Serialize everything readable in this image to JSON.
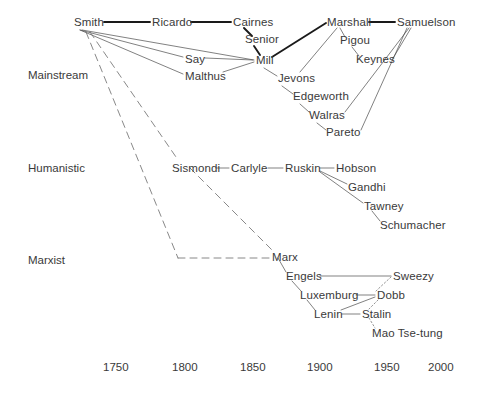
{
  "figure": {
    "type": "network-genealogy-timeline",
    "background_color": "#ffffff",
    "text_color": "#3a3a3a"
  },
  "bands": [
    {
      "id": "mainstream",
      "label": "Mainstream",
      "x": 28,
      "y": 69
    },
    {
      "id": "humanistic",
      "label": "Humanistic",
      "x": 28,
      "y": 162
    },
    {
      "id": "marxist",
      "label": "Marxist",
      "x": 28,
      "y": 254
    }
  ],
  "axis": {
    "label": "",
    "ticks": [
      {
        "value": "1750",
        "x": 103,
        "y": 361
      },
      {
        "value": "1800",
        "x": 172,
        "y": 361
      },
      {
        "value": "1850",
        "x": 240,
        "y": 361
      },
      {
        "value": "1900",
        "x": 307,
        "y": 361
      },
      {
        "value": "1950",
        "x": 374,
        "y": 361
      },
      {
        "value": "2000",
        "x": 428,
        "y": 361
      }
    ]
  },
  "nodes": [
    {
      "id": "smith",
      "label": "Smith",
      "x": 74,
      "y": 16,
      "band": "mainstream"
    },
    {
      "id": "ricardo",
      "label": "Ricardo",
      "x": 152,
      "y": 16,
      "band": "mainstream"
    },
    {
      "id": "cairnes",
      "label": "Cairnes",
      "x": 233,
      "y": 16,
      "band": "mainstream"
    },
    {
      "id": "senior",
      "label": "Senior",
      "x": 245,
      "y": 33,
      "band": "mainstream"
    },
    {
      "id": "say",
      "label": "Say",
      "x": 185,
      "y": 53,
      "band": "mainstream"
    },
    {
      "id": "malthus",
      "label": "Malthus",
      "x": 185,
      "y": 70,
      "band": "mainstream"
    },
    {
      "id": "mill",
      "label": "Mill",
      "x": 256,
      "y": 54,
      "band": "mainstream"
    },
    {
      "id": "jevons",
      "label": "Jevons",
      "x": 278,
      "y": 72,
      "band": "mainstream"
    },
    {
      "id": "edgeworth",
      "label": "Edgeworth",
      "x": 293,
      "y": 90,
      "band": "mainstream"
    },
    {
      "id": "walras",
      "label": "Walras",
      "x": 309,
      "y": 109,
      "band": "mainstream"
    },
    {
      "id": "pareto",
      "label": "Pareto",
      "x": 326,
      "y": 126,
      "band": "mainstream"
    },
    {
      "id": "marshall",
      "label": "Marshall",
      "x": 327,
      "y": 16,
      "band": "mainstream"
    },
    {
      "id": "samuelson",
      "label": "Samuelson",
      "x": 397,
      "y": 16,
      "band": "mainstream"
    },
    {
      "id": "pigou",
      "label": "Pigou",
      "x": 340,
      "y": 34,
      "band": "mainstream"
    },
    {
      "id": "keynes",
      "label": "Keynes",
      "x": 356,
      "y": 53,
      "band": "mainstream"
    },
    {
      "id": "sismondi",
      "label": "Sismondi",
      "x": 172,
      "y": 162,
      "band": "humanistic"
    },
    {
      "id": "carlyle",
      "label": "Carlyle",
      "x": 231,
      "y": 162,
      "band": "humanistic"
    },
    {
      "id": "ruskin",
      "label": "Ruskin",
      "x": 285,
      "y": 162,
      "band": "humanistic"
    },
    {
      "id": "hobson",
      "label": "Hobson",
      "x": 336,
      "y": 162,
      "band": "humanistic"
    },
    {
      "id": "gandhi",
      "label": "Gandhi",
      "x": 348,
      "y": 181,
      "band": "humanistic"
    },
    {
      "id": "tawney",
      "label": "Tawney",
      "x": 364,
      "y": 200,
      "band": "humanistic"
    },
    {
      "id": "schumacher",
      "label": "Schumacher",
      "x": 380,
      "y": 219,
      "band": "humanistic"
    },
    {
      "id": "marx",
      "label": "Marx",
      "x": 272,
      "y": 251,
      "band": "marxist"
    },
    {
      "id": "engels",
      "label": "Engels",
      "x": 286,
      "y": 270,
      "band": "marxist"
    },
    {
      "id": "sweezy",
      "label": "Sweezy",
      "x": 393,
      "y": 270,
      "band": "marxist"
    },
    {
      "id": "luxemburg",
      "label": "Luxemburg",
      "x": 300,
      "y": 289,
      "band": "marxist"
    },
    {
      "id": "dobb",
      "label": "Dobb",
      "x": 377,
      "y": 289,
      "band": "marxist"
    },
    {
      "id": "lenin",
      "label": "Lenin",
      "x": 314,
      "y": 308,
      "band": "marxist"
    },
    {
      "id": "stalin",
      "label": "Stalin",
      "x": 362,
      "y": 308,
      "band": "marxist"
    },
    {
      "id": "mao",
      "label": "Mao Tse-tung",
      "x": 372,
      "y": 327,
      "band": "marxist"
    }
  ],
  "edges": [
    {
      "from": "smith",
      "to": "ricardo",
      "style": "thick",
      "x1": 104,
      "y1": 22,
      "x2": 150,
      "y2": 22
    },
    {
      "from": "ricardo",
      "to": "cairnes",
      "style": "thick",
      "x1": 191,
      "y1": 22,
      "x2": 231,
      "y2": 22
    },
    {
      "from": "cairnes",
      "to": "senior",
      "style": "thick",
      "x1": 244,
      "y1": 28,
      "x2": 252,
      "y2": 36
    },
    {
      "from": "senior",
      "to": "mill",
      "style": "thick",
      "x1": 254,
      "y1": 46,
      "x2": 260,
      "y2": 55
    },
    {
      "from": "mill",
      "to": "marshall",
      "style": "thick",
      "x1": 272,
      "y1": 57,
      "x2": 326,
      "y2": 23
    },
    {
      "from": "marshall",
      "to": "samuelson",
      "style": "thick",
      "x1": 369,
      "y1": 22,
      "x2": 395,
      "y2": 22
    },
    {
      "from": "smith",
      "to": "say",
      "style": "thin",
      "x1": 80,
      "y1": 30,
      "x2": 183,
      "y2": 57
    },
    {
      "from": "smith",
      "to": "malthus",
      "style": "thin",
      "x1": 80,
      "y1": 30,
      "x2": 183,
      "y2": 74
    },
    {
      "from": "smith",
      "to": "mill",
      "style": "thin",
      "x1": 82,
      "y1": 30,
      "x2": 254,
      "y2": 60
    },
    {
      "from": "say",
      "to": "mill",
      "style": "thin",
      "x1": 205,
      "y1": 58,
      "x2": 253,
      "y2": 60
    },
    {
      "from": "malthus",
      "to": "mill",
      "style": "thin",
      "x1": 223,
      "y1": 72,
      "x2": 254,
      "y2": 62
    },
    {
      "from": "mill",
      "to": "jevons",
      "style": "thin",
      "x1": 264,
      "y1": 68,
      "x2": 277,
      "y2": 76
    },
    {
      "from": "jevons",
      "to": "edgeworth",
      "style": "thin",
      "x1": 282,
      "y1": 86,
      "x2": 293,
      "y2": 94
    },
    {
      "from": "edgeworth",
      "to": "walras",
      "style": "thin",
      "x1": 300,
      "y1": 104,
      "x2": 309,
      "y2": 112
    },
    {
      "from": "walras",
      "to": "pareto",
      "style": "thin",
      "x1": 317,
      "y1": 123,
      "x2": 326,
      "y2": 130
    },
    {
      "from": "marshall",
      "to": "pigou",
      "style": "thin",
      "x1": 340,
      "y1": 28,
      "x2": 345,
      "y2": 37
    },
    {
      "from": "pigou",
      "to": "keynes",
      "style": "thin",
      "x1": 352,
      "y1": 47,
      "x2": 359,
      "y2": 56
    },
    {
      "from": "marshall",
      "to": "jevons",
      "style": "thin",
      "x1": 337,
      "y1": 28,
      "x2": 300,
      "y2": 72
    },
    {
      "from": "keynes",
      "to": "samuelson",
      "style": "thin",
      "x1": 392,
      "y1": 60,
      "x2": 411,
      "y2": 28
    },
    {
      "from": "walras",
      "to": "samuelson",
      "style": "thin",
      "x1": 345,
      "y1": 112,
      "x2": 409,
      "y2": 28
    },
    {
      "from": "pareto",
      "to": "samuelson",
      "style": "thin",
      "x1": 361,
      "y1": 130,
      "x2": 407,
      "y2": 28
    },
    {
      "from": "smith",
      "to": "sismondi",
      "style": "dashed",
      "x1": 90,
      "y1": 32,
      "x2": 176,
      "y2": 157
    },
    {
      "from": "smith",
      "to": "bend",
      "style": "dashed",
      "x1": 86,
      "y1": 32,
      "x2": 178,
      "y2": 258
    },
    {
      "from": "bend",
      "to": "marx",
      "style": "dashed",
      "x1": 178,
      "y1": 258,
      "x2": 270,
      "y2": 258
    },
    {
      "from": "sismondi",
      "to": "marx",
      "style": "dashed",
      "x1": 190,
      "y1": 168,
      "x2": 272,
      "y2": 250
    },
    {
      "from": "sismondi",
      "to": "carlyle",
      "style": "thin",
      "x1": 216,
      "y1": 168,
      "x2": 229,
      "y2": 168
    },
    {
      "from": "carlyle",
      "to": "ruskin",
      "style": "thin",
      "x1": 268,
      "y1": 168,
      "x2": 283,
      "y2": 168
    },
    {
      "from": "ruskin",
      "to": "hobson",
      "style": "thin",
      "x1": 320,
      "y1": 168,
      "x2": 334,
      "y2": 168
    },
    {
      "from": "ruskin",
      "to": "gandhi",
      "style": "thin",
      "x1": 320,
      "y1": 171,
      "x2": 347,
      "y2": 184
    },
    {
      "from": "ruskin",
      "to": "tawney",
      "style": "thin",
      "x1": 320,
      "y1": 172,
      "x2": 363,
      "y2": 203
    },
    {
      "from": "tawney",
      "to": "schumacher",
      "style": "thin",
      "x1": 372,
      "y1": 211,
      "x2": 380,
      "y2": 221
    },
    {
      "from": "marx",
      "to": "engels",
      "style": "thin",
      "x1": 278,
      "y1": 258,
      "x2": 286,
      "y2": 272
    },
    {
      "from": "engels",
      "to": "sweezy",
      "style": "thin",
      "x1": 320,
      "y1": 276,
      "x2": 391,
      "y2": 276
    },
    {
      "from": "engels",
      "to": "luxemburg",
      "style": "thin",
      "x1": 292,
      "y1": 281,
      "x2": 301,
      "y2": 291
    },
    {
      "from": "luxemburg",
      "to": "lenin",
      "style": "thin",
      "x1": 307,
      "y1": 300,
      "x2": 315,
      "y2": 310
    },
    {
      "from": "luxemburg",
      "to": "dobb",
      "style": "thin",
      "x1": 356,
      "y1": 295,
      "x2": 375,
      "y2": 295
    },
    {
      "from": "lenin",
      "to": "stalin",
      "style": "thin",
      "x1": 342,
      "y1": 314,
      "x2": 360,
      "y2": 314
    },
    {
      "from": "lenin",
      "to": "dobb",
      "style": "thin",
      "x1": 341,
      "y1": 310,
      "x2": 375,
      "y2": 297
    },
    {
      "from": "sweezy",
      "to": "dobb",
      "style": "dotted",
      "x1": 391,
      "y1": 277,
      "x2": 376,
      "y2": 291
    },
    {
      "from": "dobb",
      "to": "stalin",
      "style": "dotted",
      "x1": 378,
      "y1": 300,
      "x2": 369,
      "y2": 309
    },
    {
      "from": "stalin",
      "to": "mao",
      "style": "dotted",
      "x1": 369,
      "y1": 318,
      "x2": 375,
      "y2": 328
    }
  ]
}
